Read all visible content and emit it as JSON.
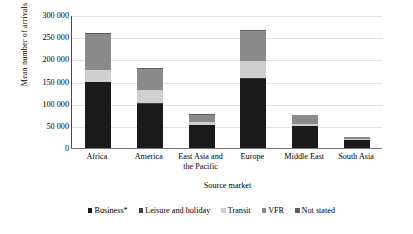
{
  "chart_data": {
    "type": "bar",
    "stacked": true,
    "title": "",
    "xlabel": "Source market",
    "ylabel": "Mean number of arrivals",
    "ylim": [
      0,
      300000
    ],
    "ytick_step": 50000,
    "ytick_labels": [
      "300 000",
      "250 000",
      "200 000",
      "150 000",
      "100 000",
      "50 000",
      "0"
    ],
    "ytick_values": [
      300000,
      250000,
      200000,
      150000,
      100000,
      50000,
      0
    ],
    "grid": true,
    "legend_position": "bottom",
    "categories": [
      "Africa",
      "America",
      "East Asia and the Pacific",
      "Europe",
      "Middle East",
      "South Asia"
    ],
    "series": [
      {
        "name": "Business*",
        "color": "#1a1a1a",
        "values": [
          148000,
          99000,
          52000,
          155000,
          49000,
          17000
        ]
      },
      {
        "name": "Leisure and holiday",
        "color": "#3f3f3f",
        "values": [
          2000,
          2000,
          1000,
          2000,
          1000,
          1000
        ]
      },
      {
        "name": "Transit",
        "color": "#cfcfcf",
        "values": [
          26000,
          30000,
          5000,
          40000,
          4000,
          2000
        ]
      },
      {
        "name": "VFR",
        "color": "#8a8a8a",
        "values": [
          82000,
          48000,
          17000,
          67000,
          20000,
          5000
        ]
      },
      {
        "name": "Not stated",
        "color": "#5e5e5e",
        "values": [
          2000,
          1000,
          1000,
          2000,
          1000,
          1000
        ]
      }
    ],
    "totals": [
      260000,
      180000,
      76000,
      266000,
      75000,
      26000
    ]
  }
}
